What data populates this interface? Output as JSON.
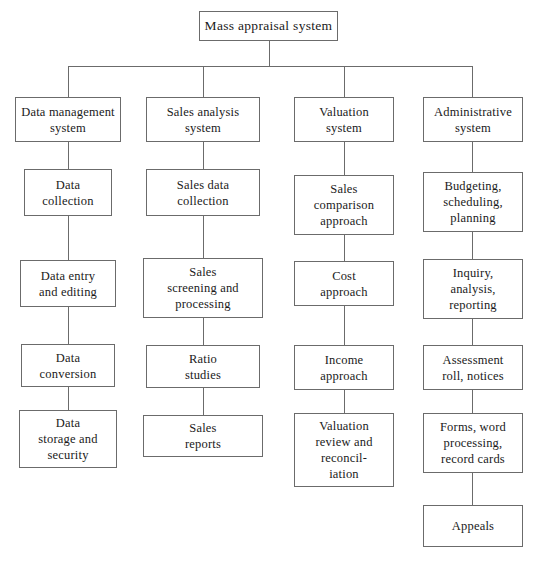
{
  "diagram": {
    "type": "organizational-tree",
    "root": {
      "label": "Mass appraisal system",
      "x": 199,
      "y": 11,
      "w": 139,
      "h": 30
    },
    "trunk": {
      "bus_y": 66,
      "bus_left": 68,
      "bus_right": 472
    },
    "columns": [
      {
        "key": "data-management",
        "center_x": 68,
        "nodes": [
          {
            "label": "Data management\nsystem",
            "x": 15,
            "y": 97,
            "w": 106,
            "h": 45
          },
          {
            "label": "Data\ncollection",
            "x": 24,
            "y": 169,
            "w": 88,
            "h": 47
          },
          {
            "label": "Data entry\nand editing",
            "x": 20,
            "y": 260,
            "w": 96,
            "h": 47
          },
          {
            "label": "Data\nconversion",
            "x": 21,
            "y": 344,
            "w": 94,
            "h": 43
          },
          {
            "label": "Data\nstorage and\nsecurity",
            "x": 19,
            "y": 410,
            "w": 98,
            "h": 58
          }
        ]
      },
      {
        "key": "sales-analysis",
        "center_x": 203,
        "nodes": [
          {
            "label": "Sales  analysis\nsystem",
            "x": 146,
            "y": 97,
            "w": 114,
            "h": 45
          },
          {
            "label": "Sales  data\ncollection",
            "x": 146,
            "y": 169,
            "w": 114,
            "h": 47
          },
          {
            "label": "Sales\nscreening and\nprocessing",
            "x": 143,
            "y": 258,
            "w": 120,
            "h": 60
          },
          {
            "label": "Ratio\nstudies",
            "x": 146,
            "y": 345,
            "w": 114,
            "h": 43
          },
          {
            "label": "Sales\nreports",
            "x": 143,
            "y": 415,
            "w": 120,
            "h": 42
          }
        ]
      },
      {
        "key": "valuation",
        "center_x": 344,
        "nodes": [
          {
            "label": "Valuation\nsystem",
            "x": 294,
            "y": 97,
            "w": 100,
            "h": 45
          },
          {
            "label": "Sales\ncomparison\napproach",
            "x": 294,
            "y": 175,
            "w": 100,
            "h": 60
          },
          {
            "label": "Cost\napproach",
            "x": 294,
            "y": 261,
            "w": 100,
            "h": 45
          },
          {
            "label": "Income\napproach",
            "x": 294,
            "y": 345,
            "w": 100,
            "h": 45
          },
          {
            "label": "Valuation\nreview and\nreconcil-\niation",
            "x": 294,
            "y": 413,
            "w": 100,
            "h": 74
          }
        ]
      },
      {
        "key": "administrative",
        "center_x": 472,
        "nodes": [
          {
            "label": "Administrative\nsystem",
            "x": 423,
            "y": 97,
            "w": 100,
            "h": 45
          },
          {
            "label": "Budgeting,\nscheduling,\nplanning",
            "x": 423,
            "y": 172,
            "w": 100,
            "h": 60
          },
          {
            "label": "Inquiry,\nanalysis,\nreporting",
            "x": 423,
            "y": 259,
            "w": 100,
            "h": 60
          },
          {
            "label": "Assessment\nroll, notices",
            "x": 423,
            "y": 345,
            "w": 100,
            "h": 45
          },
          {
            "label": "Forms, word\nprocessing,\nrecord cards",
            "x": 423,
            "y": 413,
            "w": 100,
            "h": 60
          },
          {
            "label": "Appeals",
            "x": 423,
            "y": 505,
            "w": 100,
            "h": 42
          }
        ]
      }
    ],
    "colors": {
      "border": "#6b6b6b",
      "line": "#6b6b6b",
      "text": "#1a1a1a",
      "background": "#ffffff"
    }
  }
}
